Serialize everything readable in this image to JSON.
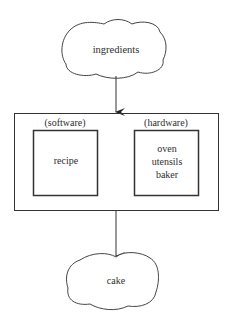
{
  "diagram": {
    "input": {
      "label": "ingredients",
      "shape": "cloud"
    },
    "process": {
      "software": {
        "heading": "(software)",
        "items": [
          "recipe"
        ]
      },
      "hardware": {
        "heading": "(hardware)",
        "items": [
          "oven",
          "utensils",
          "baker"
        ]
      }
    },
    "output": {
      "label": "cake",
      "shape": "cloud"
    },
    "edges": [
      {
        "from": "ingredients",
        "to": "process"
      },
      {
        "from": "process",
        "to": "cake"
      }
    ]
  },
  "colors": {
    "stroke": "#333333",
    "text": "#2e2e2e",
    "background": "#ffffff"
  }
}
